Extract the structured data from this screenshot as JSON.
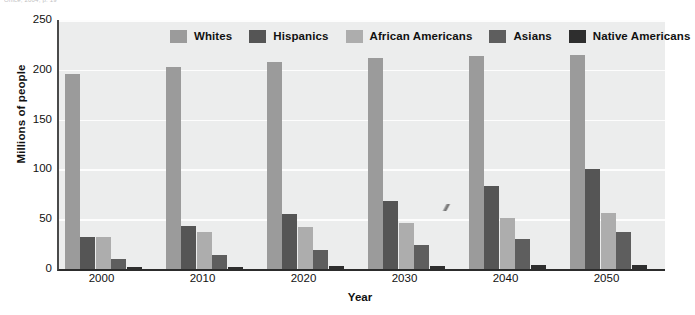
{
  "source_caption": "Office, 2004, p. 19",
  "chart_data": {
    "type": "bar",
    "title": "",
    "xlabel": "Year",
    "ylabel": "Millions of people",
    "categories": [
      "2000",
      "2010",
      "2020",
      "2030",
      "2040",
      "2050"
    ],
    "ylim": [
      0,
      250
    ],
    "yticks": [
      0,
      50,
      100,
      150,
      200,
      250
    ],
    "grid": true,
    "legend_position": "top-center",
    "series": [
      {
        "name": "Whites",
        "color": "#9b9b9b",
        "values": [
          196,
          203,
          208,
          212,
          214,
          215
        ]
      },
      {
        "name": "Hispanics",
        "color": "#555555",
        "values": [
          32,
          43,
          55,
          68,
          83,
          100
        ]
      },
      {
        "name": "African Americans",
        "color": "#adadad",
        "values": [
          32,
          37,
          42,
          46,
          51,
          56
        ]
      },
      {
        "name": "Asians",
        "color": "#5e5e5e",
        "values": [
          10,
          14,
          19,
          24,
          30,
          37
        ]
      },
      {
        "name": "Native Americans",
        "color": "#2e2e2e",
        "values": [
          2,
          2,
          3,
          3,
          4,
          4
        ]
      }
    ]
  },
  "colors": {
    "plot_background": "#eceded",
    "gridline": "#fdfdfd",
    "axis": "#2c2c2c",
    "text": "#111111"
  }
}
